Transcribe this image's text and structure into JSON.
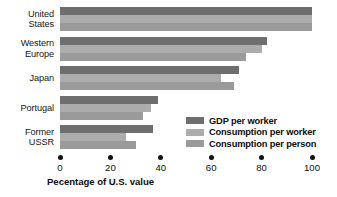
{
  "chart_data": {
    "type": "bar",
    "orientation": "horizontal",
    "title": "",
    "subtitle": "",
    "xlabel": "Pecentage of U.S. value",
    "ylabel": "",
    "xlim": [
      0,
      100
    ],
    "xticks": [
      0,
      20,
      40,
      60,
      80,
      100
    ],
    "xtick_labels": [
      "0",
      "20",
      "40",
      "60",
      "80",
      "100"
    ],
    "grid": false,
    "legend_position": "inside-lower-right",
    "categories": [
      "United\nStates",
      "Western\nEurope",
      "Japan",
      "Portugal",
      "Former\nUSSR"
    ],
    "series": [
      {
        "name": "GDP per worker",
        "color": "#6e6e6e",
        "values": [
          100,
          82,
          71,
          39,
          37
        ]
      },
      {
        "name": "Consumption per worker",
        "color": "#acacac",
        "values": [
          100,
          80,
          64,
          36,
          26
        ]
      },
      {
        "name": "Consumption per person",
        "color": "#9a9a9a",
        "values": [
          100,
          74,
          69,
          33,
          30
        ]
      }
    ]
  },
  "legend": {
    "items": [
      {
        "label": "GDP per worker",
        "color": "#6e6e6e"
      },
      {
        "label": "Consumption per worker",
        "color": "#acacac"
      },
      {
        "label": "Consumption per person",
        "color": "#9a9a9a"
      }
    ]
  },
  "colors": {
    "background": "#ffffff",
    "text": "#111111",
    "series_dark": "#6e6e6e",
    "series_light": "#acacac",
    "series_medium": "#9a9a9a"
  }
}
